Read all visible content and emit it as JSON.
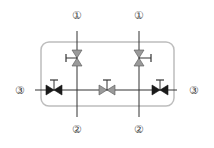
{
  "diagram": {
    "title": "",
    "colors": {
      "line": "#333333",
      "box": "#b8b8b8",
      "valve_dark": "#1a1a1a",
      "valve_light": "#9a9a9a",
      "label": "#444444"
    },
    "ports": {
      "top_left": "①",
      "top_right": "①",
      "bottom_left": "②",
      "bottom_right": "②",
      "left": "③",
      "right": "③"
    },
    "valves": [
      {
        "id": "v-top-left",
        "orientation": "vertical",
        "fill": "light",
        "handle": "left"
      },
      {
        "id": "v-top-right",
        "orientation": "vertical",
        "fill": "light",
        "handle": "right"
      },
      {
        "id": "v-bottom-left",
        "orientation": "horizontal",
        "fill": "dark",
        "handle": "top"
      },
      {
        "id": "v-bottom-middle",
        "orientation": "horizontal",
        "fill": "light",
        "handle": "top"
      },
      {
        "id": "v-bottom-right",
        "orientation": "horizontal",
        "fill": "dark",
        "handle": "top"
      }
    ]
  }
}
